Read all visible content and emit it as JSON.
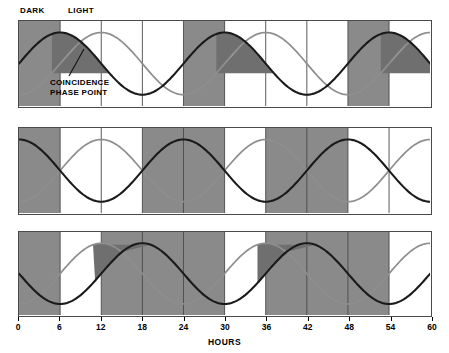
{
  "figure": {
    "header_labels": [
      {
        "name": "dark-label",
        "text": "DARK",
        "x": 20,
        "y": 6
      },
      {
        "name": "light-label",
        "text": "LIGHT",
        "x": 68,
        "y": 6
      }
    ],
    "annotation": {
      "line1": "COINCIDENCE",
      "line2": "PHASE POINT",
      "x": 50,
      "y": 78
    }
  },
  "axis": {
    "label": "HOURS",
    "ticks": [
      0,
      6,
      12,
      18,
      24,
      30,
      36,
      42,
      48,
      54,
      60
    ],
    "min": 0,
    "max": 60
  },
  "colors": {
    "dark_band": "#8a8a8a",
    "light_band": "#ffffff",
    "wave_dark": "#1a1a1a",
    "wave_light": "#8e8e8e",
    "coincidence_fill": "#6f6f6f",
    "panel_border": "#4a4a4a",
    "gridline": "#4a4a4a"
  },
  "chart_data": {
    "type": "line",
    "title": "",
    "xlabel": "HOURS",
    "ylabel": "",
    "xlim": [
      0,
      60
    ],
    "grid": true,
    "gridlines_every": 6,
    "legend": "none",
    "panels": [
      {
        "index": 1,
        "name": "panel-top",
        "y_top": 20,
        "y_bottom": 108,
        "dark_bands": [
          [
            0,
            6
          ],
          [
            24,
            30
          ],
          [
            48,
            54
          ]
        ],
        "light_bands": [
          [
            6,
            24
          ],
          [
            30,
            48
          ],
          [
            54,
            60
          ]
        ],
        "series": [
          {
            "name": "dark-wave",
            "color": "#1a1a1a",
            "period": 24,
            "peak_hours": [
              6,
              30,
              54
            ],
            "trough_hours": [
              18,
              42
            ],
            "amplitude": 1.0,
            "phase_offset": 6
          },
          {
            "name": "light-wave",
            "color": "#8e8e8e",
            "period": 24,
            "peak_hours": [
              12,
              36,
              60
            ],
            "trough_hours": [
              24,
              48
            ],
            "amplitude": 1.0,
            "phase_offset": 12
          }
        ],
        "coincidence_points": [
          9,
          33,
          57
        ],
        "has_annotation": true
      },
      {
        "index": 2,
        "name": "panel-middle",
        "y_top": 127,
        "y_bottom": 215,
        "dark_bands": [
          [
            0,
            6
          ],
          [
            18,
            30
          ],
          [
            36,
            48
          ]
        ],
        "light_bands": [
          [
            6,
            18
          ],
          [
            30,
            36
          ],
          [
            48,
            60
          ]
        ],
        "series": [
          {
            "name": "dark-wave",
            "color": "#1a1a1a",
            "period": 24,
            "peak_hours": [
              0,
              24,
              48
            ],
            "trough_hours": [
              12,
              36,
              60
            ],
            "amplitude": 1.0,
            "phase_offset": 0
          },
          {
            "name": "light-wave",
            "color": "#8e8e8e",
            "period": 24,
            "peak_hours": [
              12,
              36,
              60
            ],
            "trough_hours": [
              0,
              24,
              48
            ],
            "amplitude": 1.0,
            "phase_offset": 12
          }
        ],
        "coincidence_points": [],
        "has_annotation": false
      },
      {
        "index": 3,
        "name": "panel-bottom",
        "y_top": 231,
        "y_bottom": 317,
        "dark_bands": [
          [
            0,
            6
          ],
          [
            12,
            30
          ],
          [
            36,
            54
          ]
        ],
        "light_bands": [
          [
            6,
            12
          ],
          [
            30,
            36
          ],
          [
            54,
            60
          ]
        ],
        "series": [
          {
            "name": "dark-wave",
            "color": "#1a1a1a",
            "period": 24,
            "peak_hours": [
              18,
              42
            ],
            "trough_hours": [
              6,
              30,
              54
            ],
            "amplitude": 1.0,
            "phase_offset": 18
          },
          {
            "name": "light-wave",
            "color": "#8e8e8e",
            "period": 24,
            "peak_hours": [
              12,
              36,
              60
            ],
            "trough_hours": [
              0,
              24,
              48
            ],
            "amplitude": 1.0,
            "phase_offset": 12
          }
        ],
        "coincidence_points": [
          15,
          39
        ],
        "has_annotation": false
      }
    ]
  }
}
